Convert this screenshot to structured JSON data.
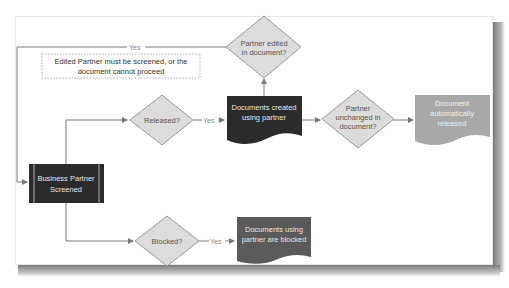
{
  "diagram": {
    "note": {
      "line1": "Edited Partner must be screened, or the",
      "line2": "document cannot proceed"
    },
    "nodes": {
      "start": {
        "line1": "Business Partner",
        "line2": "Screened"
      },
      "released": {
        "line1": "Released?"
      },
      "blocked": {
        "line1": "Blocked?"
      },
      "docs_created": {
        "line1": "Documents created",
        "line2": "using partner"
      },
      "partner_edited": {
        "line1": "Partner edited",
        "line2": "in document?"
      },
      "partner_unchanged": {
        "line1": "Partner",
        "line2": "unchanged in",
        "line3": "document?"
      },
      "doc_released": {
        "line1": "Document",
        "line2": "automatically",
        "line3": "released"
      },
      "docs_blocked": {
        "line1": "Documents using",
        "line2": "partner are blocked"
      }
    },
    "edges": {
      "yes_edited": "Yes",
      "yes_released": "Yes",
      "yes_blocked": "Yes"
    },
    "colors": {
      "dark_process": "#2b2b2b",
      "decision_fill": "#dcdcdc",
      "decision_stroke": "#9a9a9a",
      "released_doc": "#a8a8a8",
      "blocked_doc": "#5a5a5a",
      "connector": "#7a7a7a"
    }
  }
}
